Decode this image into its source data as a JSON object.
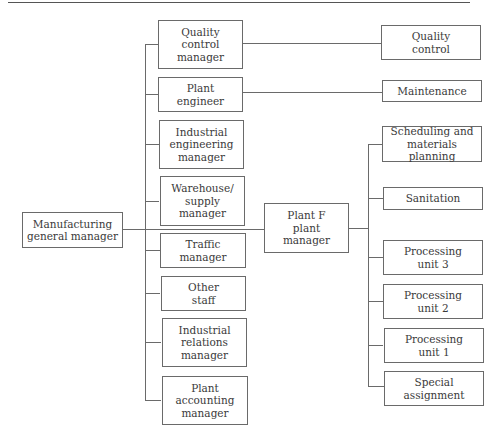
{
  "diagram": {
    "type": "org-chart",
    "root": {
      "id": "mgm",
      "label": "Manufacturing\ngeneral manager"
    },
    "staff": [
      {
        "id": "qcm",
        "label": "Quality\ncontrol\nmanager"
      },
      {
        "id": "pe",
        "label": "Plant\nengineer"
      },
      {
        "id": "iem",
        "label": "Industrial\nengineering\nmanager"
      },
      {
        "id": "wsm",
        "label": "Warehouse/\nsupply\nmanager"
      },
      {
        "id": "tm",
        "label": "Traffic\nmanager"
      },
      {
        "id": "os",
        "label": "Other\nstaff"
      },
      {
        "id": "irm",
        "label": "Industrial\nrelations\nmanager"
      },
      {
        "id": "pam",
        "label": "Plant\naccounting\nmanager"
      }
    ],
    "plant_manager": {
      "id": "pfpm",
      "label": "Plant F\nplant\nmanager"
    },
    "functional_links": [
      {
        "from": "qcm",
        "to": "qc",
        "label": "Quality\ncontrol"
      },
      {
        "from": "pe",
        "to": "mnt",
        "label": "Maintenance"
      }
    ],
    "plant_units": [
      {
        "id": "smp",
        "label": "Scheduling and\nmaterials planning"
      },
      {
        "id": "san",
        "label": "Sanitation"
      },
      {
        "id": "pu3",
        "label": "Processing\nunit 3"
      },
      {
        "id": "pu2",
        "label": "Processing\nunit 2"
      },
      {
        "id": "pu1",
        "label": "Processing\nunit 1"
      },
      {
        "id": "sa",
        "label": "Special\nassignment"
      }
    ]
  }
}
